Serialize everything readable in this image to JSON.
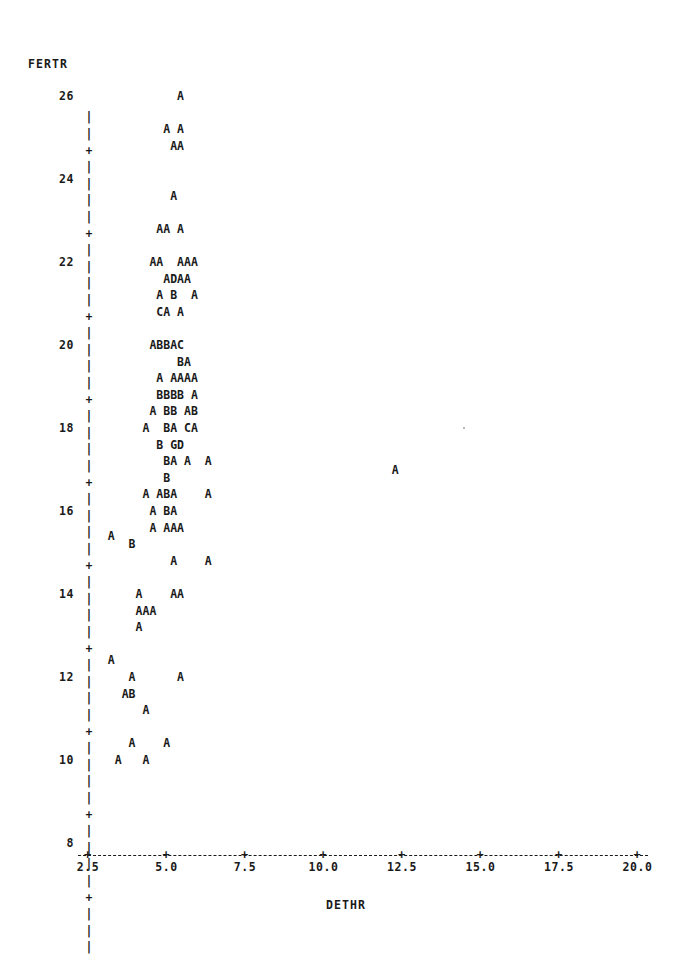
{
  "plot": {
    "type": "character-scatter",
    "style": "SAS PROC PLOT",
    "y_axis": {
      "title": "FERTR",
      "ticks": [
        26,
        24,
        22,
        20,
        18,
        16,
        14,
        12,
        10,
        8
      ],
      "tick_labels": [
        "26",
        "24",
        "22",
        "20",
        "18",
        "16",
        "14",
        "12",
        "10",
        "8"
      ],
      "tick_symbol": "+",
      "spine_symbol": "|",
      "range": [
        7.2,
        26.8
      ]
    },
    "x_axis": {
      "title": "DETHR",
      "ticks": [
        2.5,
        5.0,
        7.5,
        10.0,
        12.5,
        15.0,
        17.5,
        20.0
      ],
      "tick_labels": [
        "2.5",
        "5.0",
        "7.5",
        "10.0",
        "12.5",
        "15.0",
        "17.5",
        "20.0"
      ],
      "tick_symbol": "+",
      "axis_style": "dashed",
      "range": [
        2.2,
        20.4
      ]
    },
    "point_legend": "Letter denotes count of coincident observations: A=1, B=2, C=3, D=4, G=7"
  },
  "chart_data": {
    "type": "scatter",
    "title": "",
    "xlabel": "DETHR",
    "ylabel": "FERTR",
    "xlim": [
      2.2,
      20.4
    ],
    "ylim": [
      7.2,
      26.8
    ],
    "grid": false,
    "legend": "none",
    "marker_encoding": {
      "A": 1,
      "B": 2,
      "C": 3,
      "D": 4,
      "G": 7
    },
    "rows": [
      {
        "y": 26.0,
        "text": "            A"
      },
      {
        "y": 25.2,
        "text": "          A A"
      },
      {
        "y": 24.8,
        "text": "           AA"
      },
      {
        "y": 23.6,
        "text": "           A"
      },
      {
        "y": 22.8,
        "text": "         AA A"
      },
      {
        "y": 22.0,
        "text": "        AA  AAA"
      },
      {
        "y": 21.6,
        "text": "          ADAA"
      },
      {
        "y": 21.2,
        "text": "         A B  A"
      },
      {
        "y": 20.8,
        "text": "         CA A"
      },
      {
        "y": 20.0,
        "text": "        ABBAC"
      },
      {
        "y": 19.6,
        "text": "            BA"
      },
      {
        "y": 19.2,
        "text": "         A AAAA"
      },
      {
        "y": 18.8,
        "text": "         BBBB A"
      },
      {
        "y": 18.4,
        "text": "        A BB AB"
      },
      {
        "y": 18.0,
        "text": "       A  BA CA"
      },
      {
        "y": 17.6,
        "text": "         B GD"
      },
      {
        "y": 17.2,
        "text": "          BA A  A"
      },
      {
        "y": 16.8,
        "text": "          B"
      },
      {
        "y": 16.4,
        "text": "       A ABA    A"
      },
      {
        "y": 16.0,
        "text": "        A BA"
      },
      {
        "y": 15.6,
        "text": "        A AAA"
      },
      {
        "y": 15.4,
        "text": "  A"
      },
      {
        "y": 15.2,
        "text": "     B"
      },
      {
        "y": 14.8,
        "text": "           A    A"
      },
      {
        "y": 14.0,
        "text": "      A    AA"
      },
      {
        "y": 13.6,
        "text": "      AAA"
      },
      {
        "y": 13.2,
        "text": "      A"
      },
      {
        "y": 12.4,
        "text": "  A"
      },
      {
        "y": 12.0,
        "text": "     A      A"
      },
      {
        "y": 11.6,
        "text": "    AB"
      },
      {
        "y": 11.2,
        "text": "       A"
      },
      {
        "y": 10.4,
        "text": "     A    A"
      },
      {
        "y": 10.0,
        "text": "   A   A"
      },
      {
        "y": 17.0,
        "text": "                                           A"
      }
    ],
    "points_summary": {
      "total_rows": 34,
      "outlier": {
        "x": 19.7,
        "y": 17.0,
        "marker": "A"
      },
      "note": "Dense cluster between DETHR 4 and 7 spanning FERTR 15-22"
    }
  }
}
